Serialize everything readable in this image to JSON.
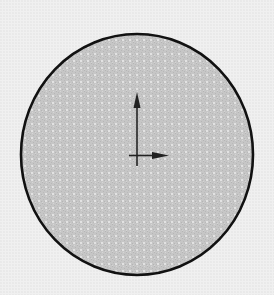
{
  "sketch": {
    "shape": "circle",
    "center": {
      "x": 137,
      "y": 154.5
    },
    "radius_x": 116,
    "radius_y": 120.5,
    "outline_color": "#111111",
    "fill_color": "#c9c9c9",
    "background_color": "#f0f0f0"
  },
  "origin_axes": {
    "origin": {
      "x": 137,
      "y": 155
    },
    "y_axis_tip": {
      "x": 137,
      "y": 93
    },
    "x_axis_tip": {
      "x": 168,
      "y": 155
    },
    "color": "#222222"
  }
}
